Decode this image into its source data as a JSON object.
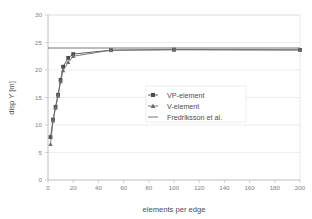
{
  "chart_data": {
    "type": "line",
    "title": "",
    "xlabel": "elements per edge",
    "ylabel": "disp Y [m]",
    "xlim": [
      0,
      200
    ],
    "ylim": [
      0,
      30
    ],
    "xticks": [
      0,
      20,
      40,
      60,
      80,
      100,
      120,
      140,
      160,
      180,
      200
    ],
    "yticks": [
      0,
      5,
      10,
      15,
      20,
      25,
      30
    ],
    "grid": "horizontal",
    "legend_position": "center-right",
    "series": [
      {
        "name": "VP-element",
        "marker": "square",
        "color": "#4d4d4d",
        "x": [
          2,
          4,
          6,
          8,
          10,
          12,
          16,
          20,
          50,
          100,
          200
        ],
        "y": [
          7.8,
          11.0,
          13.3,
          15.5,
          18.2,
          20.6,
          22.2,
          22.9,
          23.6,
          23.7,
          23.65
        ]
      },
      {
        "name": "V-element",
        "marker": "triangle",
        "color": "#6e6e6e",
        "x": [
          2,
          4,
          6,
          8,
          10,
          12,
          16,
          20,
          50,
          100,
          200
        ],
        "y": [
          6.5,
          10.8,
          13.1,
          15.3,
          17.9,
          19.9,
          21.4,
          22.5,
          23.6,
          23.7,
          23.65
        ]
      },
      {
        "name": "Fredriksson et al.",
        "marker": "none",
        "color": "#666666",
        "x": [
          0,
          200
        ],
        "y": [
          24.0,
          24.0
        ]
      }
    ]
  },
  "axes": {
    "y_title": "disp Y [m]",
    "x_title": "elements per edge",
    "y_tick_labels": [
      "0",
      "5",
      "10",
      "15",
      "20",
      "25",
      "30"
    ],
    "x_tick_labels": [
      "0",
      "20",
      "40",
      "60",
      "80",
      "100",
      "120",
      "140",
      "160",
      "180",
      "200"
    ]
  },
  "legend": {
    "entries": [
      {
        "label": "VP-element",
        "marker": "square-marker-icon"
      },
      {
        "label": "V-element",
        "marker": "triangle-marker-icon"
      },
      {
        "label": "Fredriksson et al.",
        "marker": "line-marker-icon"
      }
    ]
  },
  "colors": {
    "grid": "#e6e6e6",
    "border": "#d9d9d9",
    "text": "#808080",
    "series_primary": "#4d4d4d",
    "series_secondary": "#6e6e6e",
    "reference_line": "#666666",
    "background": "#ffffff"
  }
}
